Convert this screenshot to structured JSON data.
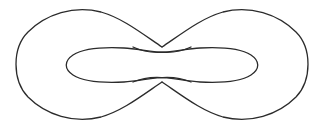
{
  "figure": {
    "canvas": {
      "width": 324,
      "height": 130,
      "background_color": "#ffffff"
    },
    "style": {
      "stroke_color": "#2b2b2b",
      "stroke_width": 1.3,
      "fill": "none"
    },
    "geometry": {
      "outer_left_extent_x": 17,
      "outer_right_extent_x": 308,
      "outer_top_extent_y": 9,
      "outer_bottom_extent_y": 119,
      "center_x": 162,
      "center_y": 65,
      "upper_crossing": {
        "x": 162,
        "y": 47
      },
      "lower_crossing": {
        "x": 162,
        "y": 82
      },
      "left_secondary_crossing_x": 133,
      "right_secondary_crossing_x": 191,
      "inner_loop_left_tip_x": 69,
      "inner_loop_right_tip_x": 256,
      "inner_loop_center_y": 65,
      "inner_loop_half_height": 17
    },
    "paths": {
      "outer_left_lobe": "M 162 47 C 140 32 122 18 101 12 C 74 5 46 14 28 32 C 12 48 12 80 28 97 C 46 115 74 124 101 117 C 122 111 140 97 162 82",
      "outer_right_lobe": "M 162 82 C 184 97 202 111 223 117 C 250 124 278 115 296 97 C 312 80 312 48 296 32 C 278 14 250 5 223 12 C 202 18 184 32 162 47",
      "inner_left_loop": "M 191 47 C 168 58 146 49 124 48 C 104 47 84 48 73 55 C 64 61 64 69 73 75 C 84 82 104 83 124 82 C 146 81 168 72 191 82",
      "inner_right_loop": "M 133 82 C 156 72 178 81 200 82 C 220 83 240 82 251 75 C 260 69 260 61 251 55 C 240 48 220 47 200 48 C 178 49 156 58 133 47"
    }
  }
}
